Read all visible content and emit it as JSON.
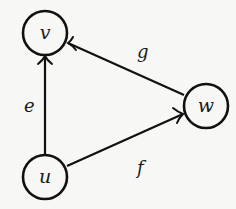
{
  "diagram": {
    "type": "directed-graph",
    "colors": {
      "background": "#f7f7f5",
      "stroke": "#111111",
      "text": "#1a1a1a"
    },
    "nodes": [
      {
        "id": "v",
        "label": "v",
        "cx": 45,
        "cy": 33,
        "r": 22
      },
      {
        "id": "w",
        "label": "w",
        "cx": 206,
        "cy": 106,
        "r": 22
      },
      {
        "id": "u",
        "label": "u",
        "cx": 45,
        "cy": 177,
        "r": 22
      }
    ],
    "edges": [
      {
        "id": "e",
        "label": "e",
        "from": "u",
        "to": "v",
        "label_x": 29,
        "label_y": 112
      },
      {
        "id": "f",
        "label": "f",
        "from": "u",
        "to": "w",
        "label_x": 141,
        "label_y": 172
      },
      {
        "id": "g",
        "label": "g",
        "from": "w",
        "to": "v",
        "label_x": 141,
        "label_y": 58
      }
    ]
  }
}
